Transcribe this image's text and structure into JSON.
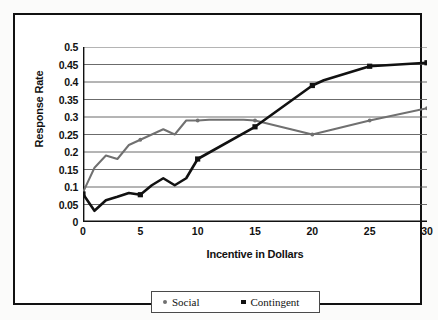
{
  "chart_data": {
    "type": "line",
    "title": "",
    "xlabel": "Incentive in Dollars",
    "ylabel": "Response Rate",
    "xlim": [
      0,
      30
    ],
    "ylim": [
      0,
      0.5
    ],
    "grid": "horizontal",
    "legend_position": "bottom",
    "x_ticks": [
      "0",
      "5",
      "10",
      "15",
      "20",
      "25",
      "30"
    ],
    "x_tick_values": [
      0,
      5,
      10,
      15,
      20,
      25,
      30
    ],
    "y_ticks": [
      "0",
      "0.05",
      "0.1",
      "0.15",
      "0.2",
      "0.25",
      "0.3",
      "0.35",
      "0.4",
      "0.45",
      "0.5"
    ],
    "y_tick_values": [
      0,
      0.05,
      0.1,
      0.15,
      0.2,
      0.25,
      0.3,
      0.35,
      0.4,
      0.45,
      0.5
    ],
    "series": [
      {
        "name": "Social",
        "color": "#707070",
        "marker": "dot",
        "x": [
          0,
          1,
          2,
          3,
          4,
          5,
          6,
          7,
          8,
          9,
          10,
          11,
          12,
          13,
          14,
          15,
          20,
          25,
          30
        ],
        "values": [
          0.085,
          0.155,
          0.19,
          0.18,
          0.22,
          0.235,
          0.25,
          0.265,
          0.25,
          0.29,
          0.29,
          0.292,
          0.292,
          0.292,
          0.292,
          0.29,
          0.25,
          0.29,
          0.325
        ]
      },
      {
        "name": "Contingent",
        "color": "#111111",
        "marker": "square",
        "x": [
          0,
          1,
          2,
          3,
          4,
          5,
          6,
          7,
          8,
          9,
          10,
          15,
          20,
          21,
          25,
          30
        ],
        "values": [
          0.08,
          0.032,
          0.062,
          0.072,
          0.083,
          0.078,
          0.105,
          0.125,
          0.105,
          0.125,
          0.18,
          0.272,
          0.39,
          0.405,
          0.445,
          0.455
        ]
      }
    ]
  },
  "legend": {
    "items": [
      {
        "label": "Social",
        "marker": "dot",
        "color": "#707070"
      },
      {
        "label": "Contingent",
        "marker": "square",
        "color": "#111111"
      }
    ]
  }
}
